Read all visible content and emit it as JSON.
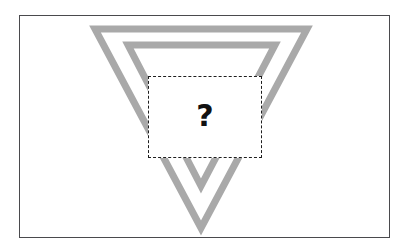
{
  "figure": {
    "kind": "occlusion-puzzle",
    "background_color": "#ffffff",
    "frame": {
      "border_color": "#4a4a4d",
      "border_width_px": 1.5,
      "x": 19,
      "y": 15,
      "width": 371,
      "height": 223
    },
    "shapes": {
      "stroke_color": "#a9a9a9",
      "stroke_width_px": 7,
      "orientation": "pointing-down",
      "count": 2,
      "outer_triangle": {
        "name": "outer-triangle",
        "points": "95,29 307,29 201,228"
      },
      "inner_triangle": {
        "name": "inner-triangle",
        "points": "128,45 275,45 201,186"
      }
    },
    "occluder": {
      "name": "dashed-occluder",
      "label": "?",
      "fill_color": "#ffffff",
      "border_color": "#1e1e1e",
      "border_style": "dashed",
      "border_width_px": 1.6,
      "dash_length_px": 5,
      "dash_gap_px": 3,
      "x": 148,
      "y": 76,
      "width": 114,
      "height": 82
    }
  }
}
